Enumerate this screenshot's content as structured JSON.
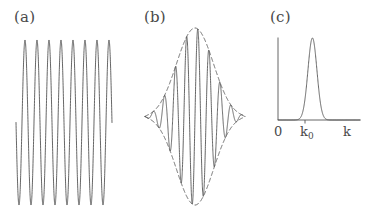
{
  "figure": {
    "background_color": "#ffffff",
    "stroke_color": "#555555",
    "text_color": "#4a4a4a",
    "width": 366,
    "height": 213
  },
  "panels": [
    {
      "id": "a",
      "label": "(a)",
      "description": "infinite monochromatic plane wave with constant amplitude"
    },
    {
      "id": "b",
      "label": "(b)",
      "description": "localized wave packet with dashed modulation envelope"
    },
    {
      "id": "c",
      "label": "(c)",
      "description": "momentum-space amplitude, narrow peak centred on k0"
    }
  ],
  "panel_c_axes": {
    "x_label_origin": "0",
    "x_label_center": "k",
    "x_label_center_sub": "0",
    "x_label_axis": "k",
    "tick_marks": [
      "k0"
    ]
  },
  "chart_data": [
    {
      "type": "line",
      "panel": "a",
      "title": "(a)",
      "xlabel": "",
      "ylabel": "",
      "grid": false,
      "legend": null,
      "series": [
        {
          "name": "plane wave",
          "form": "sin",
          "amplitude": 1.0,
          "cycles": 8.0,
          "phase_deg": 180,
          "envelope": "constant"
        }
      ],
      "xlim": [
        0,
        8
      ],
      "ylim": [
        -1.15,
        1.15
      ],
      "plot_box_px": {
        "x0": 16,
        "x1": 112,
        "y0": 40,
        "y1": 205
      }
    },
    {
      "type": "line",
      "panel": "b",
      "title": "(b)",
      "xlabel": "",
      "ylabel": "",
      "grid": false,
      "legend": null,
      "series": [
        {
          "name": "wave packet",
          "form": "sin",
          "amplitude": 1.0,
          "cycles": 9.0,
          "phase_deg": 180,
          "envelope": "gaussian-lens",
          "envelope_style": "solid"
        },
        {
          "name": "upper envelope",
          "form": "envelope",
          "envelope_style": "dashed",
          "sign": 1
        },
        {
          "name": "lower envelope",
          "form": "envelope",
          "envelope_style": "dashed",
          "sign": -1
        }
      ],
      "xlim": [
        -1,
        1
      ],
      "ylim": [
        -1.15,
        1.15
      ],
      "plot_box_px": {
        "x0": 15,
        "x1": 115,
        "y0": 28,
        "y1": 205
      }
    },
    {
      "type": "line",
      "panel": "c",
      "title": "(c)",
      "xlabel": "k",
      "ylabel": "",
      "grid": false,
      "legend": null,
      "series": [
        {
          "name": "momentum amplitude",
          "form": "gaussian",
          "center": "k0",
          "center_frac": 0.42,
          "width_frac": 0.055,
          "peak_height": 1.0
        }
      ],
      "xlim": [
        0,
        1
      ],
      "ylim": [
        0,
        1.1
      ],
      "axis_box_px": {
        "x0": 18,
        "x1": 100,
        "y_axis_top": 38,
        "y_baseline": 120
      },
      "tick_px": [
        {
          "label": "k0",
          "x": 45
        }
      ]
    }
  ]
}
